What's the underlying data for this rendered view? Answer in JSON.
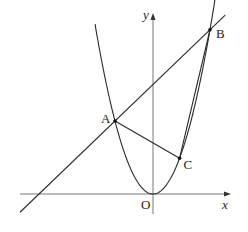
{
  "figure": {
    "curve": "y = x^2",
    "line": "y = x + 6",
    "points": [
      {
        "name": "A",
        "x": -2,
        "y": 4
      },
      {
        "name": "B",
        "x": 3,
        "y": 9
      },
      {
        "name": "C",
        "x": 1.4,
        "y": 1.96
      }
    ],
    "origin_label": "O",
    "x_axis_label": "x",
    "y_axis_label": "y",
    "segments": [
      [
        "A",
        "C"
      ],
      [
        "B",
        "C"
      ]
    ],
    "x_range": [
      -7.2,
      3.8
    ],
    "y_range": [
      -1.2,
      10.7
    ],
    "colors": {
      "stroke": "#2a2a2a",
      "axis": "#555555"
    }
  }
}
